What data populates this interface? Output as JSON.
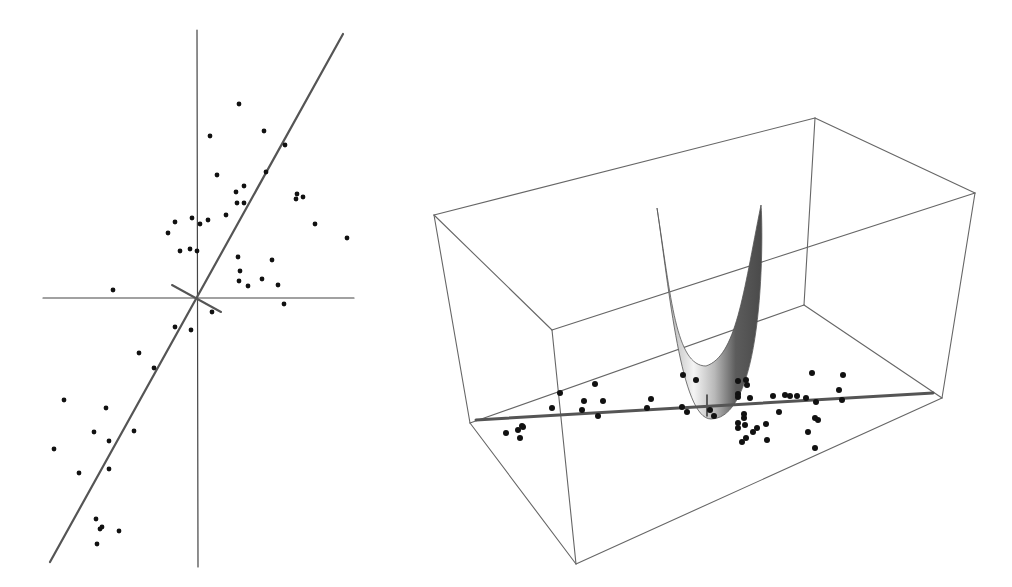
{
  "figure": {
    "width": 1012,
    "height": 587,
    "background": "#ffffff",
    "colors": {
      "axis": "#444444",
      "fit_line": "#555555",
      "point": "#111111",
      "box": "#666666",
      "surface_light": "#f2f2f2",
      "surface_mid": "#bdbdbd",
      "surface_dark": "#555555"
    }
  },
  "left_panel": {
    "type": "scatter-2d",
    "origin": [
      197,
      298
    ],
    "x_axis": [
      [
        43,
        298
      ],
      [
        354,
        298
      ]
    ],
    "y_axis": [
      [
        197,
        30
      ],
      [
        198,
        567
      ]
    ],
    "fit_line": [
      [
        343,
        34
      ],
      [
        50,
        562
      ]
    ],
    "perpendicular_line": [
      [
        172,
        285
      ],
      [
        221,
        312
      ]
    ],
    "points": [
      [
        239,
        104
      ],
      [
        264,
        131
      ],
      [
        210,
        136
      ],
      [
        285,
        145
      ],
      [
        266,
        172
      ],
      [
        217,
        175
      ],
      [
        244,
        186
      ],
      [
        236,
        192
      ],
      [
        244,
        203
      ],
      [
        237,
        203
      ],
      [
        226,
        215
      ],
      [
        297,
        194
      ],
      [
        303,
        197
      ],
      [
        296,
        199
      ],
      [
        315,
        224
      ],
      [
        347,
        238
      ],
      [
        208,
        220
      ],
      [
        175,
        222
      ],
      [
        192,
        218
      ],
      [
        200,
        224
      ],
      [
        168,
        233
      ],
      [
        180,
        251
      ],
      [
        190,
        249
      ],
      [
        197,
        251
      ],
      [
        238,
        257
      ],
      [
        272,
        260
      ],
      [
        240,
        271
      ],
      [
        262,
        279
      ],
      [
        248,
        286
      ],
      [
        239,
        281
      ],
      [
        278,
        285
      ],
      [
        113,
        290
      ],
      [
        284,
        304
      ],
      [
        212,
        312
      ],
      [
        175,
        327
      ],
      [
        191,
        330
      ],
      [
        139,
        353
      ],
      [
        154,
        368
      ],
      [
        64,
        400
      ],
      [
        106,
        408
      ],
      [
        134,
        431
      ],
      [
        94,
        432
      ],
      [
        109,
        441
      ],
      [
        109,
        469
      ],
      [
        54,
        449
      ],
      [
        79,
        473
      ],
      [
        96,
        519
      ],
      [
        102,
        527
      ],
      [
        100,
        529
      ],
      [
        119,
        531
      ],
      [
        97,
        544
      ]
    ]
  },
  "right_panel": {
    "type": "scatter-3d-with-surface",
    "box_edges": [
      [
        [
          434,
          215
        ],
        [
          815,
          118
        ]
      ],
      [
        [
          815,
          118
        ],
        [
          975,
          193
        ]
      ],
      [
        [
          434,
          215
        ],
        [
          552,
          330
        ]
      ],
      [
        [
          552,
          330
        ],
        [
          975,
          193
        ]
      ],
      [
        [
          434,
          215
        ],
        [
          470,
          423
        ]
      ],
      [
        [
          552,
          330
        ],
        [
          576,
          564
        ]
      ],
      [
        [
          975,
          193
        ],
        [
          942,
          398
        ]
      ],
      [
        [
          815,
          118
        ],
        [
          804,
          305
        ]
      ],
      [
        [
          470,
          423
        ],
        [
          804,
          305
        ]
      ],
      [
        [
          804,
          305
        ],
        [
          942,
          398
        ]
      ],
      [
        [
          470,
          423
        ],
        [
          576,
          564
        ]
      ],
      [
        [
          576,
          564
        ],
        [
          942,
          398
        ]
      ]
    ],
    "fit_line": [
      [
        476,
        420
      ],
      [
        933,
        393
      ]
    ],
    "surface": {
      "left_tip": [
        657,
        208
      ],
      "right_tip": [
        761,
        205
      ],
      "inner_bottom": [
        706,
        366
      ],
      "outer_bottom": [
        711,
        419
      ]
    },
    "stem": [
      [
        707,
        395
      ],
      [
        707,
        416
      ]
    ],
    "points": [
      [
        506,
        433
      ],
      [
        518,
        430
      ],
      [
        523,
        427
      ],
      [
        520,
        438
      ],
      [
        522,
        426
      ],
      [
        560,
        393
      ],
      [
        552,
        408
      ],
      [
        584,
        401
      ],
      [
        582,
        410
      ],
      [
        595,
        384
      ],
      [
        603,
        401
      ],
      [
        598,
        416
      ],
      [
        651,
        399
      ],
      [
        647,
        408
      ],
      [
        683,
        375
      ],
      [
        682,
        407
      ],
      [
        687,
        412
      ],
      [
        696,
        380
      ],
      [
        710,
        410
      ],
      [
        714,
        416
      ],
      [
        738,
        381
      ],
      [
        746,
        380
      ],
      [
        747,
        385
      ],
      [
        738,
        394
      ],
      [
        738,
        397
      ],
      [
        744,
        414
      ],
      [
        750,
        398
      ],
      [
        773,
        396
      ],
      [
        785,
        395
      ],
      [
        790,
        396
      ],
      [
        797,
        396
      ],
      [
        806,
        398
      ],
      [
        816,
        402
      ],
      [
        779,
        412
      ],
      [
        744,
        418
      ],
      [
        738,
        423
      ],
      [
        738,
        428
      ],
      [
        745,
        425
      ],
      [
        757,
        428
      ],
      [
        746,
        438
      ],
      [
        742,
        442
      ],
      [
        766,
        424
      ],
      [
        753,
        432
      ],
      [
        767,
        440
      ],
      [
        812,
        373
      ],
      [
        843,
        375
      ],
      [
        839,
        390
      ],
      [
        842,
        400
      ],
      [
        815,
        418
      ],
      [
        818,
        420
      ],
      [
        808,
        432
      ],
      [
        815,
        448
      ]
    ]
  }
}
